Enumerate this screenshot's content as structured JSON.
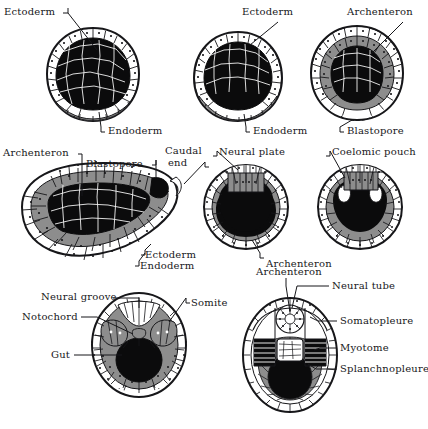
{
  "figure": {
    "colors": {
      "ink": "#17171a",
      "cell_fill_light": "#ffffff",
      "cell_fill_gray": "#8d8d8d",
      "yolk_black": "#0b0b0c",
      "background": "#ffffff"
    }
  },
  "labels": {
    "row1": [
      {
        "id": "ectoderm-1",
        "text": "Ectoderm"
      },
      {
        "id": "endoderm-1",
        "text": "Endoderm"
      },
      {
        "id": "ectoderm-2",
        "text": "Ectoderm"
      },
      {
        "id": "endoderm-2",
        "text": "Endoderm"
      },
      {
        "id": "archenteron-1",
        "text": "Archenteron"
      },
      {
        "id": "blastopore-1",
        "text": "Blastopore"
      }
    ],
    "row2": [
      {
        "id": "archenteron-2",
        "text": "Archenteron"
      },
      {
        "id": "blastopore-2",
        "text": "Blastopore"
      },
      {
        "id": "caudal-end-line1",
        "text": "Caudal"
      },
      {
        "id": "caudal-end-line2",
        "text": "end"
      },
      {
        "id": "neural-plate",
        "text": "Neural plate"
      },
      {
        "id": "coelomic-pouch",
        "text": "Coelomic pouch"
      },
      {
        "id": "ectoderm-3",
        "text": "Ectoderm"
      },
      {
        "id": "endoderm-3",
        "text": "Endoderm"
      },
      {
        "id": "archenteron-3",
        "text": "Archenteron"
      }
    ],
    "row3": [
      {
        "id": "neural-groove",
        "text": "Neural groove"
      },
      {
        "id": "notochord",
        "text": "Notochord"
      },
      {
        "id": "gut",
        "text": "Gut"
      },
      {
        "id": "somite",
        "text": "Somite"
      },
      {
        "id": "archenteron-4",
        "text": "Archenteron"
      },
      {
        "id": "neural-tube",
        "text": "Neural tube"
      },
      {
        "id": "somatopleure",
        "text": "Somatopleure"
      },
      {
        "id": "myotome",
        "text": "Myotome"
      },
      {
        "id": "splanchnopleure",
        "text": "Splanchnopleure"
      }
    ]
  },
  "stages": [
    {
      "id": "stage-1",
      "name": "blastula-early-gastrula"
    },
    {
      "id": "stage-2",
      "name": "gastrula-invagination"
    },
    {
      "id": "stage-3",
      "name": "gastrula-blastopore"
    },
    {
      "id": "stage-4",
      "name": "elongating-embryo-sagittal"
    },
    {
      "id": "stage-5",
      "name": "neural-plate-section"
    },
    {
      "id": "stage-6",
      "name": "coelomic-pouch-section"
    },
    {
      "id": "stage-7",
      "name": "neural-groove-section"
    },
    {
      "id": "stage-8",
      "name": "neural-tube-section"
    }
  ]
}
